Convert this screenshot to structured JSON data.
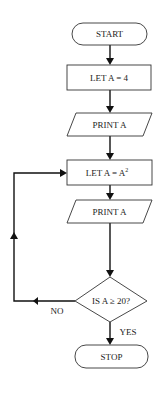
{
  "flowchart": {
    "nodes": [
      {
        "id": "start",
        "type": "terminal",
        "label": "START"
      },
      {
        "id": "let1",
        "type": "process",
        "label": "LET A = 4"
      },
      {
        "id": "print1",
        "type": "io",
        "label": "PRINT A"
      },
      {
        "id": "let2",
        "type": "process",
        "label": "LET A = A",
        "superscript": "2"
      },
      {
        "id": "print2",
        "type": "io",
        "label": "PRINT A"
      },
      {
        "id": "decision",
        "type": "decision",
        "label": "IS A ≥ 20?"
      },
      {
        "id": "stop",
        "type": "terminal",
        "label": "STOP"
      }
    ],
    "edges": [
      {
        "from": "start",
        "to": "let1",
        "label": ""
      },
      {
        "from": "let1",
        "to": "print1",
        "label": ""
      },
      {
        "from": "print1",
        "to": "let2",
        "label": ""
      },
      {
        "from": "let2",
        "to": "print2",
        "label": ""
      },
      {
        "from": "print2",
        "to": "decision",
        "label": ""
      },
      {
        "from": "decision",
        "to": "let2",
        "label": "NO"
      },
      {
        "from": "decision",
        "to": "stop",
        "label": "YES"
      }
    ],
    "edge_labels": {
      "no": "NO",
      "yes": "YES"
    }
  }
}
